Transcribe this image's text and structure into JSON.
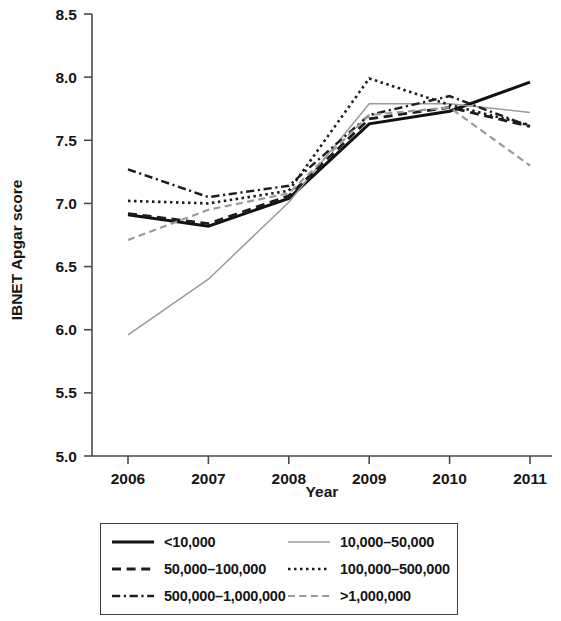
{
  "chart_data": {
    "type": "line",
    "title": "",
    "xlabel": "Year",
    "ylabel": "IBNET Apgar score",
    "x": [
      2006,
      2007,
      2008,
      2009,
      2010,
      2011
    ],
    "xtick_labels": [
      "2006",
      "2007",
      "2008",
      "2009",
      "2010",
      "2011"
    ],
    "ytick_labels": [
      "5.0",
      "5.5",
      "6.0",
      "6.5",
      "7.0",
      "7.5",
      "8.0",
      "8.5"
    ],
    "ylim": [
      5.0,
      8.5
    ],
    "ytick_values": [
      5.0,
      5.5,
      6.0,
      6.5,
      7.0,
      7.5,
      8.0,
      8.5
    ],
    "grid": false,
    "legend_position": "below-plot",
    "series": [
      {
        "name": "<10,000",
        "style": "solid",
        "color": "#111111",
        "width": 3.0,
        "values": [
          6.91,
          6.82,
          7.04,
          7.63,
          7.73,
          7.96
        ]
      },
      {
        "name": "10,000–50,000",
        "style": "solid",
        "color": "#9a9a9a",
        "width": 1.5,
        "values": [
          5.96,
          6.4,
          7.01,
          7.79,
          7.79,
          7.72
        ]
      },
      {
        "name": "50,000–100,000",
        "style": "dashed",
        "color": "#1c1c1c",
        "width": 2.8,
        "values": [
          6.92,
          6.84,
          7.06,
          7.67,
          7.76,
          7.61
        ]
      },
      {
        "name": "100,000–500,000",
        "style": "dotted",
        "color": "#1c1c1c",
        "width": 2.6,
        "values": [
          7.02,
          7.0,
          7.1,
          7.99,
          7.78,
          7.62
        ]
      },
      {
        "name": "500,000–1,000,000",
        "style": "dashdot",
        "color": "#1c1c1c",
        "width": 2.4,
        "values": [
          7.27,
          7.05,
          7.14,
          7.7,
          7.85,
          7.61
        ]
      },
      {
        "name": ">1,000,000",
        "style": "dashed",
        "color": "#9a9a9a",
        "width": 2.2,
        "values": [
          6.71,
          6.95,
          7.08,
          7.7,
          7.76,
          7.3
        ]
      }
    ]
  },
  "legend": {
    "items": [
      {
        "label": "<10,000",
        "icon": "solid-line-swatch"
      },
      {
        "label": "10,000–50,000",
        "icon": "thin-gray-line-swatch"
      },
      {
        "label": "50,000–100,000",
        "icon": "dashed-line-swatch"
      },
      {
        "label": "100,000–500,000",
        "icon": "dotted-line-swatch"
      },
      {
        "label": "500,000–1,000,000",
        "icon": "dash-dot-line-swatch"
      },
      {
        "label": ">1,000,000",
        "icon": "gray-dashed-line-swatch"
      }
    ]
  }
}
